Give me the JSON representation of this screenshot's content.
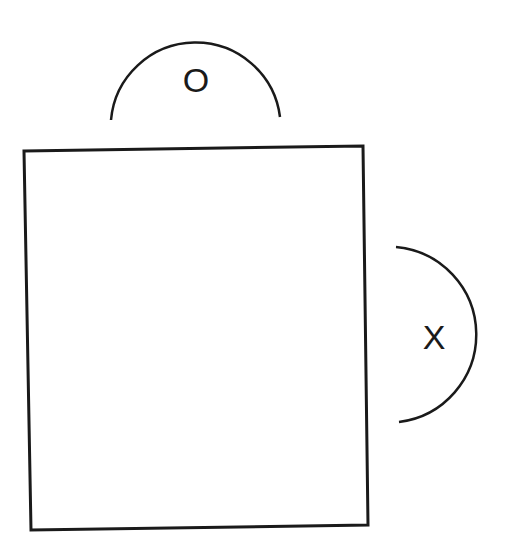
{
  "diagram": {
    "top_arc": {
      "label": "O"
    },
    "right_arc": {
      "label": "X"
    },
    "stroke_color": "#1a1a1a",
    "background": "#ffffff"
  }
}
